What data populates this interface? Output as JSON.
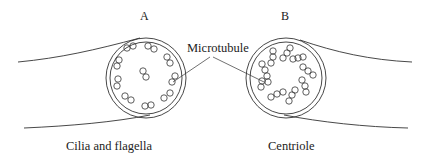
{
  "figure": {
    "panels": [
      {
        "id": "A",
        "letter": "A",
        "caption": "Cilia and flagella",
        "structure": "9 doublet microtubules in a ring plus 2 central microtubules (9+2)"
      },
      {
        "id": "B",
        "letter": "B",
        "caption": "Centriole",
        "structure": "9 triplet microtubules in a ring, no central pair (9+0)"
      }
    ],
    "callout": {
      "label": "Microtubule",
      "points_to": [
        "A",
        "B"
      ]
    },
    "colors": {
      "stroke": "#333333",
      "text": "#222222",
      "background": "#ffffff"
    }
  }
}
